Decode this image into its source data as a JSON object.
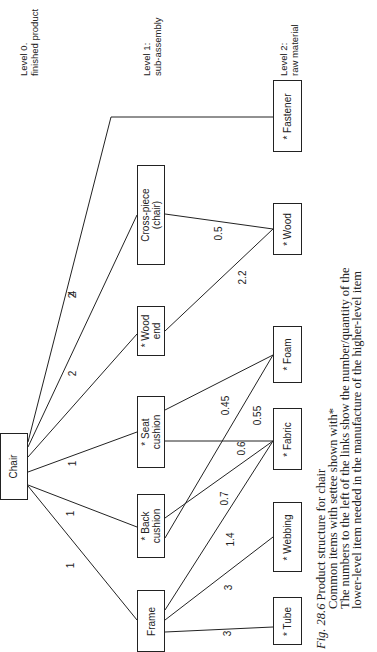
{
  "levels": [
    {
      "line1": "Level 0.",
      "line2": "finished product"
    },
    {
      "line1": "Level 1:",
      "line2": "sub-assembly"
    },
    {
      "line1": "Level 2:",
      "line2": "raw material"
    }
  ],
  "nodes": {
    "chair": "Chair",
    "frame": "Frame",
    "back_cushion": "* Back cushion",
    "seat_cushion": "* Seat cushion",
    "wood_end": "* Wood end",
    "cross_piece": "Cross-piece (chair)",
    "fastener": "* Fastener",
    "wood": "* Wood",
    "foam": "* Foam",
    "fabric": "* Fabric",
    "webbing": "* Webbing",
    "tube": "* Tube"
  },
  "links": [
    {
      "from": "Chair",
      "to": "Frame",
      "qty": "1"
    },
    {
      "from": "Chair",
      "to": "Back cushion",
      "qty": "1"
    },
    {
      "from": "Chair",
      "to": "Seat cushion",
      "qty": "1"
    },
    {
      "from": "Chair",
      "to": "Wood end",
      "qty": "2"
    },
    {
      "from": "Chair",
      "to": "Cross-piece",
      "qty": "2"
    },
    {
      "from": "Chair",
      "to": "Fastener",
      "qty": "4"
    },
    {
      "from": "Cross-piece",
      "to": "Wood",
      "qty": "0.5"
    },
    {
      "from": "Wood end",
      "to": "Wood",
      "qty": "2.2"
    },
    {
      "from": "Seat cushion",
      "to": "Foam",
      "qty": "0.45"
    },
    {
      "from": "Back cushion",
      "to": "Foam",
      "qty": "0.55"
    },
    {
      "from": "Seat cushion",
      "to": "Fabric",
      "qty": "0.6"
    },
    {
      "from": "Back cushion",
      "to": "Fabric",
      "qty": "0.7"
    },
    {
      "from": "Frame",
      "to": "Fabric",
      "qty": "1.4"
    },
    {
      "from": "Frame",
      "to": "Webbing",
      "qty": "3"
    },
    {
      "from": "Frame",
      "to": "Tube",
      "qty": "3"
    }
  ],
  "caption": {
    "fig": "Fig. 28.6",
    "title": "Product structure for chair",
    "line2": "Common items with settee shown with*",
    "line3": "The numbers to the left of the links show the number/quantity of the",
    "line4": "lower-level item needed in the manufacture of the higher-level item"
  }
}
